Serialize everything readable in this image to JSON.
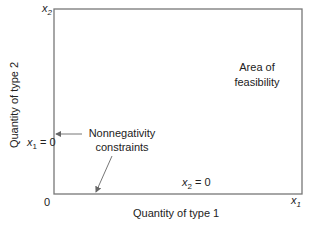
{
  "diagram": {
    "axes": {
      "x_end_label": "x",
      "x_end_sub": "1",
      "y_end_label": "x",
      "y_end_sub": "2",
      "origin": "0",
      "xlabel": "Quantity of type 1",
      "ylabel": "Quantity of type 2"
    },
    "region_label_line1": "Area of",
    "region_label_line2": "feasibility",
    "annotation_line1": "Nonnegativity",
    "annotation_line2": "constraints",
    "x1_constraint": {
      "var": "x",
      "sub": "1",
      "rest": "= 0"
    },
    "x2_constraint": {
      "var": "x",
      "sub": "2",
      "rest": "= 0"
    },
    "colors": {
      "box": "#777777",
      "text": "#222222",
      "arrow": "#666666"
    }
  }
}
